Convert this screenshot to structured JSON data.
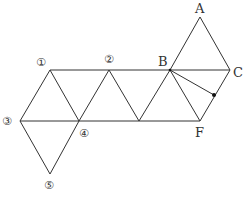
{
  "diagram": {
    "labels": {
      "A": "A",
      "B": "B",
      "C": "C",
      "F": "F",
      "n1": "①",
      "n2": "②",
      "n3": "③",
      "n4": "④",
      "n5": "⑤"
    },
    "colors": {
      "line": "#333333",
      "background": "#ffffff"
    }
  }
}
